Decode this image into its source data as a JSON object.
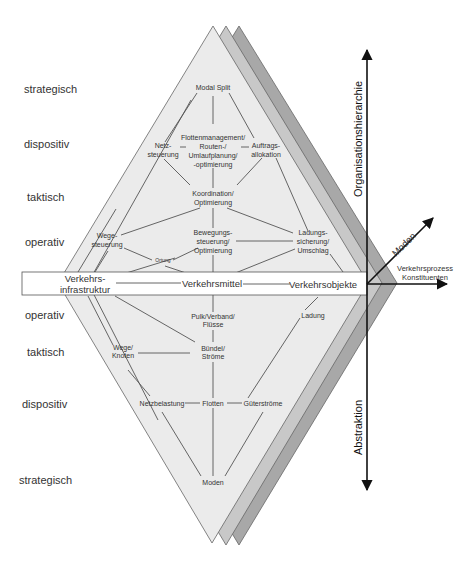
{
  "levels_left": {
    "upper": [
      "strategisch",
      "dispositiv",
      "taktisch",
      "operativ"
    ],
    "lower": [
      "operativ",
      "taktisch",
      "dispositiv",
      "strategisch"
    ]
  },
  "upper_nodes": {
    "modal_split": "Modal Split",
    "netzsteuerung": [
      "Netz-",
      "steuerung"
    ],
    "flottenmanagement": [
      "Flottenmanagement/",
      "Routen-/",
      "Umlaufplanung/",
      "-optimierung"
    ],
    "auftragsallokation": [
      "Auftrags-",
      "allokation"
    ],
    "koordination": [
      "Koordination/",
      "Optimierung"
    ],
    "wegesteuerung": [
      "Wege-",
      "steuerung"
    ],
    "bewegungssteuerung": [
      "Bewegungs-",
      "steuerung/",
      "Optimierung"
    ],
    "ladungssicherung": [
      "Ladungs-",
      "sicherung/",
      "Umschlag"
    ],
    "ortung": "Ortung"
  },
  "band": {
    "infrastruktur": [
      "Verkehrs-",
      "infrastruktur"
    ],
    "verkehrsmittel": "Verkehrsmittel",
    "verkehrsobjekte": "Verkehrsobjekte"
  },
  "lower_nodes": {
    "pulk": [
      "Pulk/Verband/",
      "Flüsse"
    ],
    "ladung": "Ladung",
    "wege_knoten": [
      "Wege/",
      "Knoten"
    ],
    "buendel": [
      "Bündel/",
      "Ströme"
    ],
    "netzbelastung": "Netzbelastung",
    "flotten": "Flotten",
    "gueterstroeme": "Güterströme",
    "moden": "Moden"
  },
  "axes": {
    "vertical_up": "Organisationshierarchie",
    "vertical_down": "Abstraktion",
    "diagonal": "Moden",
    "horizontal": [
      "Verkehrsprozess",
      "Konstituenten"
    ]
  },
  "colors": {
    "front_diamond": "#ebebeb",
    "middle_diamond": "#c8c8c8",
    "back_diamond": "#a8a8a8",
    "lines": "#555555",
    "axis": "#111111"
  }
}
